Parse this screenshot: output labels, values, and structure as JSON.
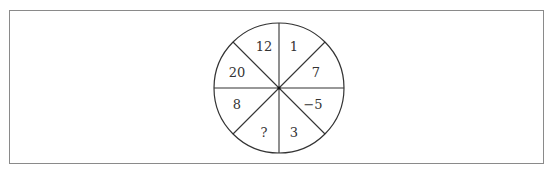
{
  "diagram": {
    "type": "number-wheel",
    "sectors": 8,
    "center": {
      "x": 279,
      "y": 88
    },
    "radius": 65,
    "colors": {
      "frame": "#8a8a8a",
      "lines": "#333333",
      "text": "#333333"
    },
    "labels": [
      {
        "id": "top-right",
        "value": "1",
        "x": 294,
        "y": 46
      },
      {
        "id": "right-upper",
        "value": "7",
        "x": 316,
        "y": 72
      },
      {
        "id": "right-lower",
        "value": "−5",
        "x": 313,
        "y": 104
      },
      {
        "id": "bottom-right",
        "value": "3",
        "x": 294,
        "y": 132
      },
      {
        "id": "bottom-left",
        "value": "?",
        "x": 264,
        "y": 132
      },
      {
        "id": "left-lower",
        "value": "8",
        "x": 237,
        "y": 104
      },
      {
        "id": "left-upper",
        "value": "20",
        "x": 237,
        "y": 72
      },
      {
        "id": "top-left",
        "value": "12",
        "x": 264,
        "y": 46
      }
    ]
  }
}
